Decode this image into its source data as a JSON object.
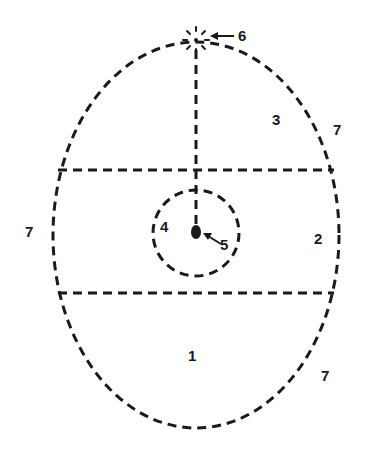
{
  "diagram": {
    "colors": {
      "stroke": "#1a1a1a",
      "background": "#ffffff"
    },
    "outer_ellipse": {
      "cx": 196,
      "cy": 235,
      "rx": 143,
      "ry": 193
    },
    "upper_line_y": 170,
    "lower_line_y": 293,
    "inner_circle": {
      "cx": 196,
      "cy": 233,
      "r": 43
    },
    "center_dot": {
      "cx": 196,
      "cy": 232
    },
    "top_point": {
      "cx": 196,
      "cy": 40
    },
    "labels": [
      {
        "id": "1",
        "text": "1",
        "x": 188,
        "y": 348
      },
      {
        "id": "2",
        "text": "2",
        "x": 314,
        "y": 231
      },
      {
        "id": "3",
        "text": "3",
        "x": 272,
        "y": 112
      },
      {
        "id": "4",
        "text": "4",
        "x": 160,
        "y": 219
      },
      {
        "id": "5",
        "text": "5",
        "x": 220,
        "y": 237
      },
      {
        "id": "6",
        "text": "6",
        "x": 238,
        "y": 28
      },
      {
        "id": "7-top-right",
        "text": "7",
        "x": 333,
        "y": 122
      },
      {
        "id": "7-left",
        "text": "7",
        "x": 25,
        "y": 224
      },
      {
        "id": "7-bottom-right",
        "text": "7",
        "x": 321,
        "y": 368
      }
    ]
  }
}
